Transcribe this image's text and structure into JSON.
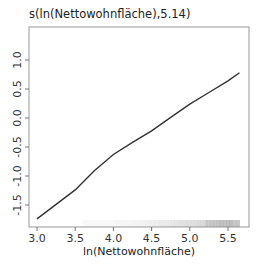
{
  "chart_data": {
    "type": "line",
    "title": "s(ln(Nettowohnfläche),5.14)",
    "xlabel": "ln(Nettowohnfläche)",
    "ylabel": "",
    "xlim": [
      2.99,
      5.7
    ],
    "ylim": [
      -1.87,
      1.5
    ],
    "x_ticks": [
      3.0,
      3.5,
      4.0,
      4.5,
      5.0,
      5.5
    ],
    "x_tick_labels": [
      "3.0",
      "3.5",
      "4.0",
      "4.5",
      "5.0",
      "5.5"
    ],
    "y_ticks": [
      -1.5,
      -1.0,
      -0.5,
      0.0,
      0.5,
      1.0
    ],
    "y_tick_labels": [
      "-1.5",
      "-1.0",
      "-0.5",
      "0.0",
      "0.5",
      "1.0"
    ],
    "grid": false,
    "legend": null,
    "series": [
      {
        "name": "s(ln(Nettowohnfläche),5.14)",
        "color": "#333333",
        "x": [
          3.0,
          3.25,
          3.5,
          3.75,
          4.0,
          4.25,
          4.5,
          4.75,
          5.0,
          5.25,
          5.5,
          5.65
        ],
        "values": [
          -1.74,
          -1.49,
          -1.24,
          -0.91,
          -0.63,
          -0.42,
          -0.22,
          0.01,
          0.24,
          0.44,
          0.64,
          0.78
        ]
      }
    ],
    "rug": {
      "description": "density rug of observations along x-axis",
      "range": [
        3.6,
        5.65
      ],
      "densest": [
        5.2,
        5.55
      ],
      "color": "#888888"
    }
  }
}
